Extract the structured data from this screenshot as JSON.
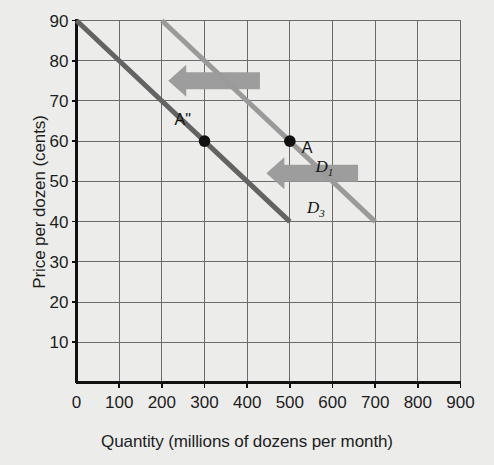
{
  "chart_data": {
    "type": "line",
    "title": "",
    "xlabel": "Quantity (millions of dozens per month)",
    "ylabel": "Price per dozen (cents)",
    "xlim": [
      0,
      900
    ],
    "ylim": [
      0,
      90
    ],
    "xticks": [
      "0",
      "100",
      "200",
      "300",
      "400",
      "500",
      "600",
      "700",
      "800",
      "900"
    ],
    "yticks": [
      "10",
      "20",
      "30",
      "40",
      "50",
      "60",
      "70",
      "80",
      "90"
    ],
    "grid": true,
    "legend_position": "inline-curve-labels",
    "series": [
      {
        "name": "D1",
        "label": "D",
        "label_sub": "1",
        "color": "#9a9a9a",
        "x": [
          200,
          700
        ],
        "y": [
          90,
          40
        ],
        "label_x": 560,
        "label_y": 53
      },
      {
        "name": "D3",
        "label": "D",
        "label_sub": "3",
        "color": "#636363",
        "x": [
          0,
          500
        ],
        "y": [
          90,
          40
        ],
        "label_x": 540,
        "label_y": 43
      }
    ],
    "points": [
      {
        "name": "A",
        "label": "A",
        "x": 500,
        "y": 60,
        "color": "#111111",
        "label_dx": 12,
        "label_dy": 16
      },
      {
        "name": "A-double-prime",
        "label": "A\"",
        "x": 300,
        "y": 60,
        "color": "#111111",
        "label_dx": -30,
        "label_dy": -12
      }
    ],
    "annotations": [
      {
        "name": "shift-arrow-upper",
        "direction": "left",
        "x_from": 430,
        "x_to": 215,
        "y": 75,
        "color": "#9d9d9d"
      },
      {
        "name": "shift-arrow-lower",
        "direction": "left",
        "x_from": 660,
        "x_to": 445,
        "y": 52,
        "color": "#9d9d9d"
      }
    ],
    "colors": {
      "background": "#ececeb",
      "grid": "#6b6b6b",
      "axis": "#111111",
      "d1": "#9a9a9a",
      "d3": "#636363",
      "arrow": "#9d9d9d"
    }
  }
}
